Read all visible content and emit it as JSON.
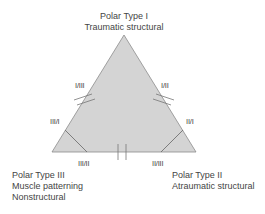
{
  "diagram": {
    "type": "triangle",
    "fill_color": "#d4d4d4",
    "stroke_color": "#8c8c8c",
    "vertices": {
      "top": {
        "title": "Polar Type I",
        "subtitle": "Traumatic structural"
      },
      "bottom_right": {
        "title": "Polar Type II",
        "subtitle": "Atraumatic structural"
      },
      "bottom_left": {
        "title": "Polar Type III",
        "line2": "Muscle patterning",
        "line3": "Nonstructural"
      }
    },
    "edge_labels": {
      "left_upper": "I/III",
      "right_upper": "I/II",
      "left_lower": "III/I",
      "right_lower": "II/I",
      "bottom_left": "III/II",
      "bottom_right": "II/III"
    }
  }
}
